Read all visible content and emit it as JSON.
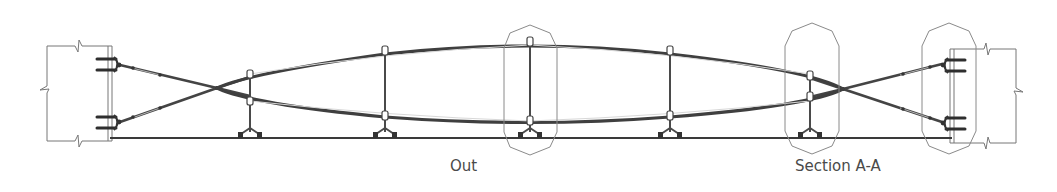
{
  "diagram": {
    "labels": {
      "out": "Out",
      "section": "Section A-A"
    },
    "colors": {
      "line": "#3f3f3f",
      "thin": "#8a8a8a",
      "text": "#4a4a4a",
      "background": "#ffffff"
    },
    "struts_x": [
      250,
      385,
      530,
      670,
      810
    ],
    "callouts": [
      {
        "name": "detail-callout-center",
        "cx": 530
      },
      {
        "name": "detail-callout-section",
        "cx": 812
      },
      {
        "name": "detail-callout-anchor",
        "cx": 949
      }
    ]
  }
}
